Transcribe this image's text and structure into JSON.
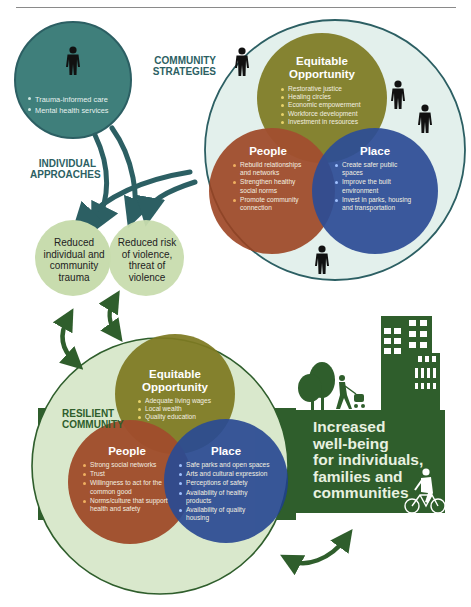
{
  "colors": {
    "teal": "#3f7f7b",
    "teal_dark": "#2c5f63",
    "olive": "#7e7a22",
    "rust": "#9c4220",
    "blue": "#1e3f8f",
    "pale_green": "#d9e8cc",
    "outcome_green": "#c8dcae",
    "forest": "#2f5e2c",
    "community_bg": "#e3f0ec"
  },
  "individual": {
    "label": "INDIVIDUAL APPROACHES",
    "label_line1": "INDIVIDUAL",
    "label_line2": "APPROACHES",
    "icon": "person-icon",
    "items": [
      "Trauma-informed care",
      "Mental health services"
    ]
  },
  "community_strategies": {
    "label_line1": "COMMUNITY",
    "label_line2": "STRATEGIES",
    "equitable": {
      "title_line1": "Equitable",
      "title_line2": "Opportunity",
      "items": [
        "Restorative justice",
        "Healing circles",
        "Economic empowerment",
        "Workforce development",
        "Investment in resources"
      ]
    },
    "people": {
      "title": "People",
      "items": [
        "Rebuild relationships and networks",
        "Strengthen healthy social norms",
        "Promote community connection"
      ]
    },
    "place": {
      "title": "Place",
      "items": [
        "Create safer public spaces",
        "Improve the built environment",
        "Invest in parks, housing and transportation"
      ]
    }
  },
  "outcomes": {
    "trauma": {
      "line1": "Reduced",
      "line2": "individual and",
      "line3": "community",
      "line4": "trauma"
    },
    "violence": {
      "line1": "Reduced risk",
      "line2": "of violence,",
      "line3": "threat of",
      "line4": "violence"
    }
  },
  "resilient_community": {
    "label_line1": "RESILIENT",
    "label_line2": "COMMUNITY",
    "equitable": {
      "title_line1": "Equitable",
      "title_line2": "Opportunity",
      "items": [
        "Adequate living wages",
        "Local wealth",
        "Quality education"
      ]
    },
    "people": {
      "title": "People",
      "items": [
        "Strong social networks",
        "Trust",
        "Willingness to act for the common good",
        "Norms/culture that support health and safety"
      ]
    },
    "place": {
      "title": "Place",
      "items": [
        "Safe parks and open spaces",
        "Arts and cultural expression",
        "Perceptions of safety",
        "Availability of healthy products",
        "Availability of quality housing"
      ]
    }
  },
  "wellbeing": {
    "line1": "Increased",
    "line2": "well-being",
    "line3": "for individuals,",
    "line4": "families and",
    "line5": "communities"
  }
}
